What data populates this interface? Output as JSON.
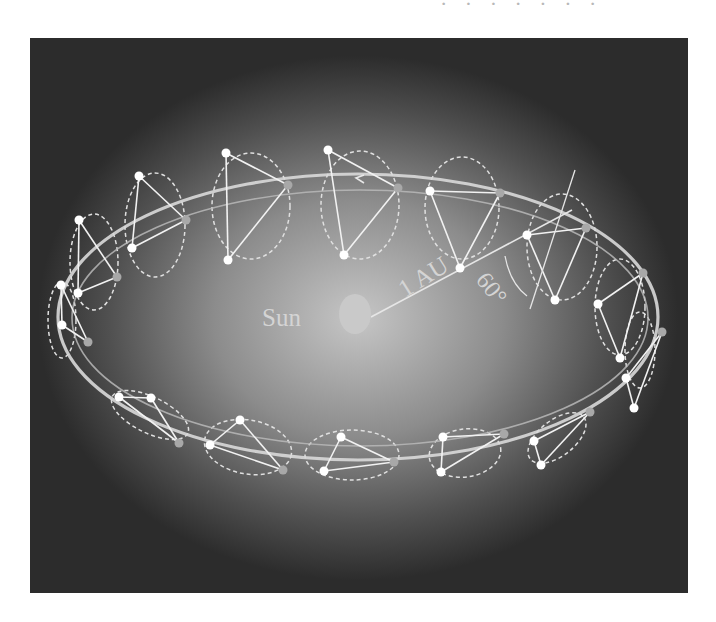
{
  "header": {
    "fragment_text": "· · · · · · ·"
  },
  "figure": {
    "background": {
      "outer": "#2b2b2b",
      "glow_center": "#bdbdbd",
      "glow_mid": "#7a7a7a"
    },
    "sun": {
      "label": "Sun",
      "cx": 355,
      "cy": 314,
      "rx": 16,
      "ry": 20,
      "color": "#c9c9c9"
    },
    "distance_label": "1 AU",
    "angle_label": "60°",
    "orbit_outer": {
      "cx": 358,
      "cy": 317,
      "rx": 300,
      "ry": 143
    },
    "orbit_inner": {
      "cx": 360,
      "cy": 318,
      "rx": 288,
      "ry": 128
    },
    "direction_arrow": "‹",
    "constellations": [
      {
        "a": [
          61,
          285
        ],
        "b": [
          62,
          325
        ],
        "c": [
          88,
          342
        ],
        "ring": [
          62,
          320,
          14,
          38,
          0
        ]
      },
      {
        "a": [
          79,
          220
        ],
        "b": [
          78,
          293
        ],
        "c": [
          117,
          277
        ],
        "ring": [
          94,
          262,
          24,
          48,
          0
        ]
      },
      {
        "a": [
          139,
          176
        ],
        "b": [
          132,
          248
        ],
        "c": [
          186,
          220
        ],
        "ring": [
          155,
          225,
          30,
          52,
          0
        ]
      },
      {
        "a": [
          226,
          153
        ],
        "b": [
          228,
          260
        ],
        "c": [
          288,
          185
        ],
        "ring": [
          251,
          206,
          39,
          53,
          0
        ]
      },
      {
        "a": [
          328,
          150
        ],
        "b": [
          344,
          255
        ],
        "c": [
          398,
          188
        ],
        "ring": [
          360,
          205,
          39,
          54,
          0
        ]
      },
      {
        "a": [
          430,
          191
        ],
        "b": [
          460,
          268
        ],
        "c": [
          500,
          193
        ],
        "ring": [
          462,
          208,
          37,
          51,
          0
        ]
      },
      {
        "a": [
          527,
          235
        ],
        "b": [
          555,
          300
        ],
        "c": [
          586,
          228
        ],
        "ring": [
          562,
          247,
          35,
          53,
          0
        ]
      },
      {
        "a": [
          598,
          304
        ],
        "b": [
          620,
          358
        ],
        "c": [
          643,
          273
        ],
        "ring": [
          620,
          307,
          25,
          48,
          0
        ]
      },
      {
        "a": [
          626,
          378
        ],
        "b": [
          634,
          408
        ],
        "c": [
          662,
          332
        ],
        "ring": [
          640,
          350,
          15,
          38,
          0
        ]
      },
      {
        "a": [
          534,
          441
        ],
        "b": [
          541,
          465
        ],
        "c": [
          590,
          412
        ],
        "ring": [
          557,
          438,
          34,
          18,
          -38
        ]
      },
      {
        "a": [
          443,
          437
        ],
        "b": [
          441,
          472
        ],
        "c": [
          504,
          434
        ],
        "ring": [
          465,
          453,
          36,
          24,
          -8
        ]
      },
      {
        "a": [
          341,
          437
        ],
        "b": [
          324,
          471
        ],
        "c": [
          394,
          462
        ],
        "ring": [
          352,
          455,
          47,
          25,
          0
        ]
      },
      {
        "a": [
          210,
          445
        ],
        "b": [
          240,
          420
        ],
        "c": [
          283,
          470
        ],
        "ring": [
          248,
          447,
          44,
          27,
          10
        ]
      },
      {
        "a": [
          119,
          397
        ],
        "b": [
          151,
          398
        ],
        "c": [
          179,
          443
        ],
        "ring": [
          150,
          415,
          42,
          18,
          26
        ]
      }
    ]
  }
}
